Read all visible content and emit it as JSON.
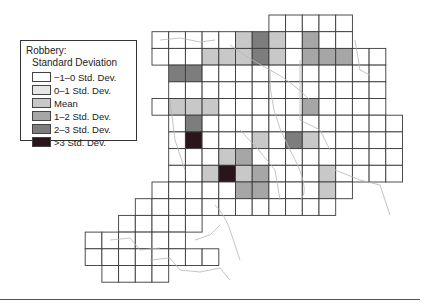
{
  "legend": {
    "title": "Robbery:",
    "subtitle": "Standard Deviation",
    "items": [
      {
        "label": "−1–0 Std. Dev.",
        "color": "#ffffff",
        "pattern": "none"
      },
      {
        "label": "0–1 Std. Dev.",
        "color": "#e6e6e6",
        "pattern": "dotted"
      },
      {
        "label": "Mean",
        "color": "#c8c8c8",
        "pattern": "none"
      },
      {
        "label": "1–2 Std. Dev.",
        "color": "#a6a6a6",
        "pattern": "none"
      },
      {
        "label": "2–3 Std. Dev.",
        "color": "#7d7d7d",
        "pattern": "none"
      },
      {
        "label": ">3 Std. Dev.",
        "color": "#2a161a",
        "pattern": "none"
      }
    ]
  },
  "grid": {
    "x0": 152,
    "y0": 15,
    "cell": 16.7,
    "line_color": "#3a3a3a",
    "cells": [
      [
        7,
        0,
        0
      ],
      [
        8,
        0,
        0
      ],
      [
        9,
        0,
        0
      ],
      [
        10,
        0,
        0
      ],
      [
        11,
        0,
        0
      ],
      [
        0,
        1,
        0
      ],
      [
        1,
        1,
        0
      ],
      [
        2,
        1,
        0
      ],
      [
        3,
        1,
        0
      ],
      [
        4,
        1,
        0
      ],
      [
        5,
        1,
        2
      ],
      [
        6,
        1,
        4
      ],
      [
        7,
        1,
        2
      ],
      [
        8,
        1,
        0
      ],
      [
        9,
        1,
        3
      ],
      [
        10,
        1,
        0
      ],
      [
        11,
        1,
        0
      ],
      [
        0,
        2,
        0
      ],
      [
        1,
        2,
        0
      ],
      [
        2,
        2,
        0
      ],
      [
        3,
        2,
        2
      ],
      [
        4,
        2,
        2
      ],
      [
        5,
        2,
        2
      ],
      [
        6,
        2,
        4
      ],
      [
        7,
        2,
        2
      ],
      [
        8,
        2,
        0
      ],
      [
        9,
        2,
        3
      ],
      [
        10,
        2,
        3
      ],
      [
        11,
        2,
        3
      ],
      [
        12,
        2,
        0
      ],
      [
        13,
        2,
        0
      ],
      [
        1,
        3,
        4
      ],
      [
        2,
        3,
        4
      ],
      [
        3,
        3,
        0
      ],
      [
        4,
        3,
        0
      ],
      [
        5,
        3,
        0
      ],
      [
        6,
        3,
        0
      ],
      [
        7,
        3,
        0
      ],
      [
        8,
        3,
        0
      ],
      [
        9,
        3,
        0
      ],
      [
        10,
        3,
        0
      ],
      [
        11,
        3,
        0
      ],
      [
        12,
        3,
        0
      ],
      [
        13,
        3,
        0
      ],
      [
        1,
        4,
        0
      ],
      [
        2,
        4,
        0
      ],
      [
        3,
        4,
        0
      ],
      [
        4,
        4,
        0
      ],
      [
        5,
        4,
        0
      ],
      [
        6,
        4,
        0
      ],
      [
        7,
        4,
        0
      ],
      [
        8,
        4,
        0
      ],
      [
        9,
        4,
        0
      ],
      [
        10,
        4,
        0
      ],
      [
        11,
        4,
        0
      ],
      [
        12,
        4,
        0
      ],
      [
        13,
        4,
        0
      ],
      [
        0,
        5,
        0
      ],
      [
        1,
        5,
        2
      ],
      [
        2,
        5,
        2
      ],
      [
        3,
        5,
        2
      ],
      [
        4,
        5,
        0
      ],
      [
        5,
        5,
        0
      ],
      [
        6,
        5,
        0
      ],
      [
        7,
        5,
        0
      ],
      [
        8,
        5,
        0
      ],
      [
        9,
        5,
        3
      ],
      [
        10,
        5,
        0
      ],
      [
        11,
        5,
        0
      ],
      [
        12,
        5,
        0
      ],
      [
        13,
        5,
        0
      ],
      [
        1,
        6,
        0
      ],
      [
        2,
        6,
        4
      ],
      [
        3,
        6,
        0
      ],
      [
        4,
        6,
        0
      ],
      [
        5,
        6,
        0
      ],
      [
        6,
        6,
        0
      ],
      [
        7,
        6,
        0
      ],
      [
        8,
        6,
        0
      ],
      [
        9,
        6,
        0
      ],
      [
        10,
        6,
        0
      ],
      [
        11,
        6,
        0
      ],
      [
        12,
        6,
        0
      ],
      [
        13,
        6,
        0
      ],
      [
        14,
        6,
        0
      ],
      [
        1,
        7,
        0
      ],
      [
        2,
        7,
        5
      ],
      [
        3,
        7,
        0
      ],
      [
        4,
        7,
        0
      ],
      [
        5,
        7,
        0
      ],
      [
        6,
        7,
        2
      ],
      [
        7,
        7,
        0
      ],
      [
        8,
        7,
        4
      ],
      [
        9,
        7,
        2
      ],
      [
        10,
        7,
        0
      ],
      [
        11,
        7,
        0
      ],
      [
        12,
        7,
        0
      ],
      [
        13,
        7,
        0
      ],
      [
        14,
        7,
        0
      ],
      [
        1,
        8,
        0
      ],
      [
        2,
        8,
        0
      ],
      [
        3,
        8,
        0
      ],
      [
        4,
        8,
        2
      ],
      [
        5,
        8,
        3
      ],
      [
        6,
        8,
        0
      ],
      [
        7,
        8,
        0
      ],
      [
        8,
        8,
        0
      ],
      [
        9,
        8,
        0
      ],
      [
        10,
        8,
        0
      ],
      [
        11,
        8,
        0
      ],
      [
        12,
        8,
        0
      ],
      [
        13,
        8,
        0
      ],
      [
        14,
        8,
        0
      ],
      [
        1,
        9,
        0
      ],
      [
        2,
        9,
        0
      ],
      [
        3,
        9,
        2
      ],
      [
        4,
        9,
        5
      ],
      [
        5,
        9,
        2
      ],
      [
        6,
        9,
        3
      ],
      [
        7,
        9,
        0
      ],
      [
        8,
        9,
        0
      ],
      [
        9,
        9,
        0
      ],
      [
        10,
        9,
        2
      ],
      [
        11,
        9,
        0
      ],
      [
        12,
        9,
        0
      ],
      [
        13,
        9,
        0
      ],
      [
        14,
        9,
        0
      ],
      [
        0,
        10,
        0
      ],
      [
        1,
        10,
        0
      ],
      [
        2,
        10,
        0
      ],
      [
        3,
        10,
        0
      ],
      [
        4,
        10,
        0
      ],
      [
        5,
        10,
        3
      ],
      [
        6,
        10,
        3
      ],
      [
        7,
        10,
        0
      ],
      [
        8,
        10,
        0
      ],
      [
        9,
        10,
        0
      ],
      [
        10,
        10,
        2
      ],
      [
        11,
        10,
        0
      ],
      [
        -1,
        11,
        0
      ],
      [
        0,
        11,
        0
      ],
      [
        1,
        11,
        0
      ],
      [
        2,
        11,
        0
      ],
      [
        3,
        11,
        0
      ],
      [
        4,
        11,
        0
      ],
      [
        5,
        11,
        0
      ],
      [
        6,
        11,
        0
      ],
      [
        7,
        11,
        0
      ],
      [
        8,
        11,
        0
      ],
      [
        9,
        11,
        0
      ],
      [
        10,
        11,
        0
      ],
      [
        -2,
        12,
        0
      ],
      [
        -1,
        12,
        0
      ],
      [
        0,
        12,
        0
      ],
      [
        1,
        12,
        0
      ],
      [
        2,
        12,
        0
      ],
      [
        -4,
        13,
        0
      ],
      [
        -3,
        13,
        0
      ],
      [
        -2,
        13,
        0
      ],
      [
        -1,
        13,
        0
      ],
      [
        0,
        13,
        0
      ],
      [
        1,
        13,
        0
      ],
      [
        -4,
        14,
        0
      ],
      [
        -3,
        14,
        0
      ],
      [
        -2,
        14,
        0
      ],
      [
        -1,
        14,
        0
      ],
      [
        0,
        14,
        0
      ],
      [
        1,
        14,
        0
      ],
      [
        2,
        14,
        0
      ],
      [
        3,
        14,
        0
      ],
      [
        -3,
        15,
        0
      ],
      [
        -2,
        15,
        0
      ],
      [
        -1,
        15,
        0
      ],
      [
        0,
        15,
        0
      ]
    ]
  }
}
